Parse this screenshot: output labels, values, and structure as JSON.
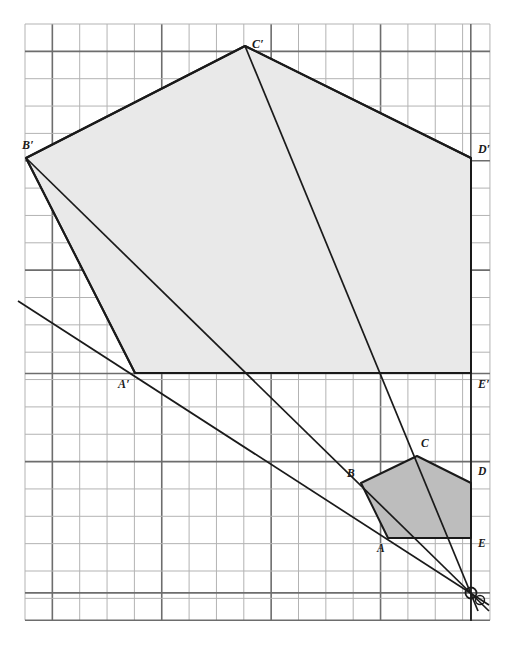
{
  "figure": {
    "canvas": {
      "width": 520,
      "height": 646
    },
    "background_color": "#ffffff",
    "grid": {
      "origin_x": 25,
      "origin_y": 24,
      "spacing": 27.35,
      "cols": 17,
      "rows": 21.8,
      "line_color": "#b3b3b3",
      "line_width": 1,
      "emphasis_line_color": "#6d6d6d",
      "emphasis_line_width": 1.6,
      "emphasis_vertical_cols": [
        1,
        5,
        9,
        13,
        16.3
      ],
      "emphasis_horizontal_rows": [
        1,
        5,
        9,
        12.78,
        16,
        20.8
      ]
    },
    "styles": {
      "preimage_fill": "#bdbdbd",
      "image_fill": "#e9e9e9",
      "edge_color": "#1a1a1a",
      "edge_width": 2,
      "ray_color": "#1a1a1a",
      "ray_width": 1.7,
      "center_marker_color": "#1a1a1a"
    },
    "preimage": {
      "name": "pentagon-abcde",
      "fill": "#bdbdbd",
      "vertices": [
        {
          "label": "A",
          "x": 388,
          "y": 538,
          "label_x": 377,
          "label_y": 543
        },
        {
          "label": "B",
          "x": 361,
          "y": 483,
          "label_x": 347,
          "label_y": 468
        },
        {
          "label": "C",
          "x": 417,
          "y": 456,
          "label_x": 421,
          "label_y": 438
        },
        {
          "label": "D",
          "x": 471,
          "y": 483,
          "label_x": 478,
          "label_y": 466
        },
        {
          "label": "E",
          "x": 471,
          "y": 538,
          "label_x": 478,
          "label_y": 538
        }
      ]
    },
    "image": {
      "name": "pentagon-a-prime-b-prime-c-prime-d-prime-e-prime",
      "fill": "#e9e9e9",
      "vertices": [
        {
          "label": "A′",
          "x": 135,
          "y": 373,
          "label_x": 118,
          "label_y": 378
        },
        {
          "label": "B′",
          "x": 26,
          "y": 158,
          "label_x": 22,
          "label_y": 139
        },
        {
          "label": "C′",
          "x": 245,
          "y": 46,
          "label_x": 252,
          "label_y": 38
        },
        {
          "label": "D′",
          "x": 471,
          "y": 158,
          "label_x": 478,
          "label_y": 143
        },
        {
          "label": "E′",
          "x": 471,
          "y": 373,
          "label_x": 478,
          "label_y": 378
        }
      ]
    },
    "center_of_dilation": {
      "label": "O",
      "x": 471,
      "y": 593,
      "radius": 5.5
    },
    "rays": [
      {
        "name": "ray-through-a",
        "from_x": 471,
        "from_y": 593,
        "to_x": 18,
        "to_y": 301,
        "extend_x": 489,
        "extend_y": 605
      },
      {
        "name": "ray-through-b",
        "from_x": 471,
        "from_y": 593,
        "to_x": 26,
        "to_y": 158,
        "extend_x": 489,
        "extend_y": 611
      },
      {
        "name": "ray-through-c",
        "from_x": 471,
        "from_y": 593,
        "to_x": 245,
        "to_y": 46,
        "extend_x": 478,
        "extend_y": 611
      },
      {
        "name": "ray-through-d",
        "from_x": 471,
        "from_y": 593,
        "to_x": 471,
        "to_y": 158,
        "extend_x": 471,
        "extend_y": 621
      }
    ],
    "connector_segments": [
      {
        "name": "segment-b-prime-to-a-prime",
        "x1": 26,
        "y1": 158,
        "x2": 135,
        "y2": 373
      },
      {
        "name": "segment-b-prime-to-c-prime",
        "x1": 26,
        "y1": 158,
        "x2": 245,
        "y2": 46
      },
      {
        "name": "segment-c-prime-to-d-prime",
        "x1": 245,
        "y1": 46,
        "x2": 471,
        "y2": 158
      }
    ],
    "labels_note": "Primed labels mark the dilated image; unprimed labels mark the original pentagon."
  }
}
